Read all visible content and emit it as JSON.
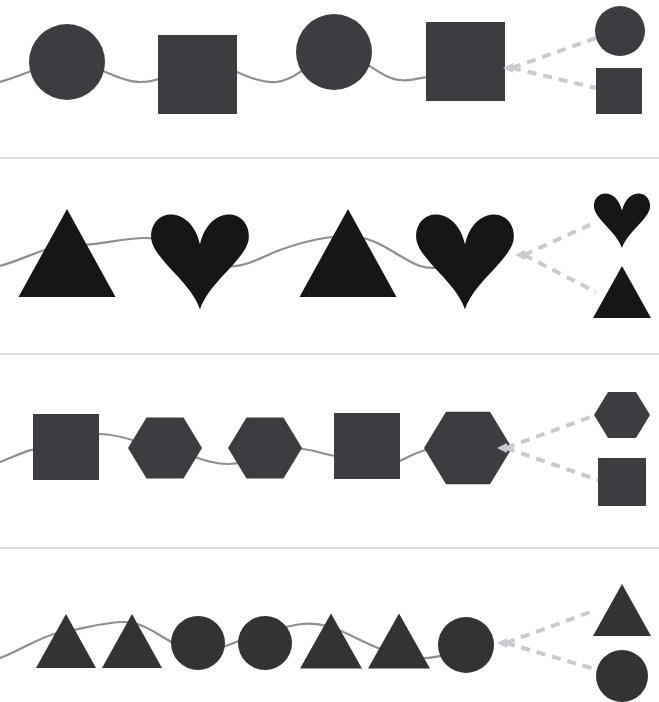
{
  "page": {
    "background_color": "#ffffff",
    "width": 659,
    "height": 702
  },
  "style": {
    "divider_color": "#dcdce0",
    "divider_thickness": 2,
    "connector_line_color": "#8e8e94",
    "connector_line_width": 2.2,
    "dashed_color": "#c9c9cf",
    "dashed_width": 4,
    "dash_pattern": "9 7"
  },
  "dividers": [
    {
      "name": "divider-1",
      "y": 158
    },
    {
      "name": "divider-2",
      "y": 354
    },
    {
      "name": "divider-3",
      "y": 548
    }
  ],
  "rows": [
    {
      "id": "row-1",
      "label": "Circle square alternating sequence",
      "shape_color": "#3d3d41",
      "sequence": [
        {
          "shape": "circle",
          "cx": 67,
          "cy": 62,
          "r": 38
        },
        {
          "shape": "square",
          "x": 158,
          "y": 35,
          "size": 79
        },
        {
          "shape": "circle",
          "cx": 334,
          "cy": 52,
          "r": 38
        },
        {
          "shape": "square",
          "x": 426,
          "y": 22,
          "size": 79
        }
      ],
      "connector_path": "M 0 82 C 28 74 48 62 67 62 C 95 62 118 82 140 82 C 170 82 185 60 198 60 C 222 60 250 84 276 82 C 300 80 318 52 334 52 C 360 52 378 78 400 80 C 415 82 418 76 440 76",
      "choice_vertex": {
        "x": 512,
        "y": 68
      },
      "choices": [
        {
          "name": "choice-circle",
          "shape": "circle",
          "cx": 620,
          "cy": 31,
          "r": 25,
          "anchor_x": 596,
          "anchor_y": 38
        },
        {
          "name": "choice-square",
          "shape": "square",
          "x": 596,
          "y": 68,
          "size": 46,
          "anchor_x": 596,
          "anchor_y": 88
        }
      ]
    },
    {
      "id": "row-2",
      "label": "Triangle heart alternating sequence",
      "shape_color": "#161617",
      "sequence": [
        {
          "shape": "triangle",
          "cx": 67,
          "cy": 253,
          "width": 97,
          "height": 88
        },
        {
          "shape": "heart",
          "cx": 200,
          "cy": 252,
          "size": 94
        },
        {
          "shape": "triangle",
          "cx": 348,
          "cy": 253,
          "width": 97,
          "height": 88
        },
        {
          "shape": "heart",
          "cx": 465,
          "cy": 252,
          "size": 94
        }
      ],
      "connector_path": "M 0 266 C 28 258 46 246 67 246 C 96 246 122 238 144 238 C 170 238 188 252 210 262 C 238 274 258 258 280 250 C 305 241 326 236 348 236 C 378 236 398 258 420 266 C 440 272 448 262 470 258",
      "choice_vertex": {
        "x": 524,
        "y": 255
      },
      "choices": [
        {
          "name": "choice-heart",
          "shape": "heart",
          "cx": 622,
          "cy": 215,
          "size": 54,
          "anchor_x": 596,
          "anchor_y": 222
        },
        {
          "name": "choice-triangle",
          "shape": "triangle",
          "cx": 622,
          "cy": 292,
          "width": 58,
          "height": 52,
          "anchor_x": 596,
          "anchor_y": 292
        }
      ]
    },
    {
      "id": "row-3",
      "label": "Square hexagon hexagon square hexagon sequence",
      "shape_color": "#3d3d41",
      "sequence": [
        {
          "shape": "square",
          "x": 33,
          "y": 414,
          "size": 66
        },
        {
          "shape": "hexagon",
          "cx": 165,
          "cy": 448,
          "r": 37
        },
        {
          "shape": "hexagon",
          "cx": 265,
          "cy": 448,
          "r": 37
        },
        {
          "shape": "square",
          "x": 334,
          "y": 413,
          "size": 66
        },
        {
          "shape": "hexagon",
          "cx": 468,
          "cy": 448,
          "r": 44
        }
      ],
      "connector_path": "M 0 462 C 18 455 30 448 44 448 C 70 448 86 434 100 434 C 122 434 140 444 162 448 C 190 453 206 464 228 464 C 252 464 268 448 290 448 C 312 448 320 454 336 456 C 352 458 362 464 384 464 C 404 464 412 450 436 448",
      "choice_vertex": {
        "x": 506,
        "y": 448
      },
      "choices": [
        {
          "name": "choice-hexagon",
          "shape": "hexagon",
          "cx": 622,
          "cy": 415,
          "r": 28,
          "anchor_x": 596,
          "anchor_y": 415
        },
        {
          "name": "choice-square",
          "shape": "square",
          "x": 598,
          "y": 458,
          "size": 48,
          "anchor_x": 598,
          "anchor_y": 480
        }
      ]
    },
    {
      "id": "row-4",
      "label": "Triangle triangle circle circle triangle triangle circle sequence",
      "shape_color": "#333336",
      "sequence": [
        {
          "shape": "triangle",
          "cx": 66,
          "cy": 641,
          "width": 60,
          "height": 54
        },
        {
          "shape": "triangle",
          "cx": 132,
          "cy": 641,
          "width": 60,
          "height": 54
        },
        {
          "shape": "circle",
          "cx": 198,
          "cy": 643,
          "r": 27
        },
        {
          "shape": "circle",
          "cx": 265,
          "cy": 643,
          "r": 27
        },
        {
          "shape": "triangle",
          "cx": 331,
          "cy": 641,
          "width": 62,
          "height": 55
        },
        {
          "shape": "triangle",
          "cx": 399,
          "cy": 641,
          "width": 62,
          "height": 55
        },
        {
          "shape": "circle",
          "cx": 466,
          "cy": 645,
          "r": 28
        }
      ],
      "connector_path": "M 0 658 C 22 650 40 636 62 632 C 86 628 104 622 124 622 C 150 622 168 646 192 650 C 216 654 232 642 248 638 C 268 633 282 626 302 624 C 322 622 336 628 356 638 C 376 648 396 656 414 658 C 428 660 436 656 452 654",
      "choice_vertex": {
        "x": 506,
        "y": 643
      },
      "choices": [
        {
          "name": "choice-triangle",
          "shape": "triangle",
          "cx": 622,
          "cy": 610,
          "width": 58,
          "height": 52,
          "anchor_x": 596,
          "anchor_y": 610
        },
        {
          "name": "choice-circle",
          "shape": "circle",
          "cx": 622,
          "cy": 676,
          "r": 26,
          "anchor_x": 598,
          "anchor_y": 670
        }
      ]
    }
  ]
}
